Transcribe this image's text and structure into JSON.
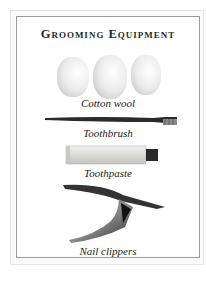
{
  "page": {
    "title": "Grooming Equipment",
    "items": [
      {
        "label": "Cotton wool",
        "icon": "cotton-wool-image"
      },
      {
        "label": "Toothbrush",
        "icon": "toothbrush-image"
      },
      {
        "label": "Toothpaste",
        "icon": "toothpaste-image"
      },
      {
        "label": "Nail clippers",
        "icon": "nail-clippers-image"
      }
    ]
  }
}
